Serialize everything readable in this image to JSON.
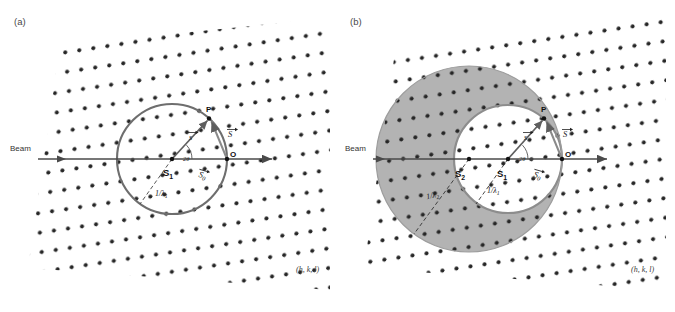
{
  "figure": {
    "width": 675,
    "height": 312,
    "background": "#ffffff",
    "dot_color": "#262626",
    "circle_color": "#6e6e6e",
    "annulus_fill": "#b3b3b3",
    "axis_color": "#4a4a4a",
    "vector_color": "#5a5a5a"
  },
  "panels": [
    {
      "id": "a",
      "label": "(a)",
      "beam_label": "Beam",
      "hkl_label": "(h, k, l)",
      "origin_label": "O",
      "reflection_label": "P",
      "center_label": "S",
      "center_subscript": "1",
      "angle_label": "2θ",
      "radius_labels": [
        {
          "text": "1/λ",
          "subscript": "1"
        }
      ],
      "vectors": [
        {
          "name": "s-vector",
          "label": "s"
        },
        {
          "name": "S-vector",
          "label": "S"
        },
        {
          "name": "S0-vector",
          "label": "S",
          "subscript": "0"
        }
      ],
      "geometry": {
        "circle_center": [
          172,
          159
        ],
        "circle_radius": 55,
        "origin": [
          227,
          159
        ],
        "reflection_point": [
          209,
          118
        ]
      }
    },
    {
      "id": "b",
      "label": "(b)",
      "beam_label": "Beam",
      "hkl_label": "(h, k, l)",
      "origin_label": "O",
      "reflection_label": "P",
      "center_labels": [
        {
          "text": "S",
          "subscript": "2"
        },
        {
          "text": "S",
          "subscript": "1"
        }
      ],
      "angle_label": "2θ",
      "radius_labels": [
        {
          "text": "1/λ",
          "subscript": "2"
        },
        {
          "text": "1/λ",
          "subscript": "1"
        }
      ],
      "vectors": [
        {
          "name": "s-vector",
          "label": "s"
        },
        {
          "name": "S-vector",
          "label": "S"
        },
        {
          "name": "S0-vector",
          "label": "S",
          "subscript": "0"
        }
      ],
      "geometry": {
        "inner_circle_center": [
          508,
          159
        ],
        "inner_circle_radius": 54,
        "outer_circle_center": [
          469,
          159
        ],
        "outer_circle_radius": 93,
        "origin": [
          562,
          159
        ],
        "reflection_point": [
          544,
          118
        ]
      }
    }
  ]
}
